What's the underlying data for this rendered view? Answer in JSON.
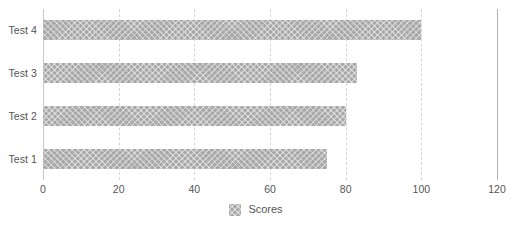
{
  "chart_data": {
    "type": "bar",
    "orientation": "horizontal",
    "title": "",
    "xlabel": "",
    "ylabel": "",
    "categories": [
      "Test 4",
      "Test 3",
      "Test 2",
      "Test 1"
    ],
    "values": [
      100,
      83,
      80,
      75
    ],
    "series": [
      {
        "name": "Scores",
        "values": [
          100,
          83,
          80,
          75
        ]
      }
    ],
    "xlim": [
      0,
      120
    ],
    "xticks": [
      0,
      20,
      40,
      60,
      80,
      100,
      120
    ],
    "xtick_labels": [
      "0",
      "20",
      "40",
      "60",
      "80",
      "100",
      "120"
    ],
    "grid": "vertical-dashed",
    "legend": {
      "position": "bottom-center",
      "entries": [
        {
          "label": "Scores",
          "swatch": "hatched-gray-square"
        }
      ]
    }
  },
  "style": {
    "bar_color": "#a9a9a9",
    "bar_pattern": "cross-hatch",
    "gridline_color": "#d6d6d6",
    "axis_color": "#c9c9c9",
    "border_color": "#b4b4b4",
    "text_color": "#555555",
    "background": "#ffffff"
  }
}
